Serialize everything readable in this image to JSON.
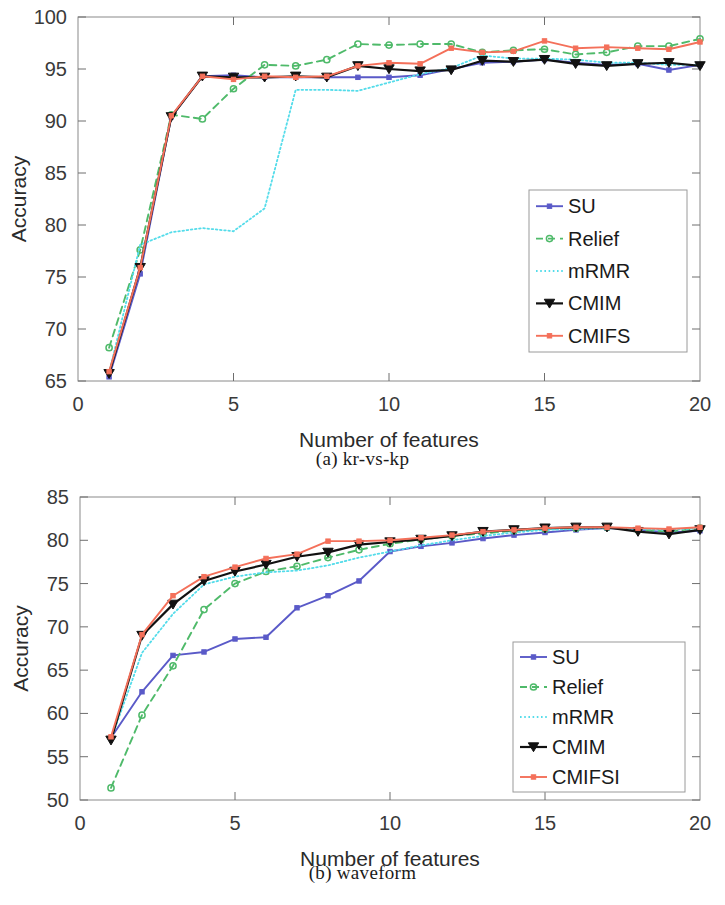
{
  "figure": {
    "panels": [
      {
        "id": "a",
        "caption": "(a)  kr-vs-kp",
        "xlabel": "Number of features",
        "ylabel": "Accuracy",
        "xticks": [
          "0",
          "5",
          "10",
          "15",
          "20"
        ],
        "yticks": [
          "65",
          "70",
          "75",
          "80",
          "85",
          "90",
          "95",
          "100"
        ],
        "legend": [
          "SU",
          "Relief",
          "mRMR",
          "CMIM",
          "CMIFS"
        ]
      },
      {
        "id": "b",
        "caption": "(b)  waveform",
        "xlabel": "Number of features",
        "ylabel": "Accuracy",
        "xticks": [
          "0",
          "5",
          "10",
          "15",
          "20"
        ],
        "yticks": [
          "50",
          "55",
          "60",
          "65",
          "70",
          "75",
          "80",
          "85"
        ],
        "legend": [
          "SU",
          "Relief",
          "mRMR",
          "CMIM",
          "CMIFSI"
        ]
      }
    ]
  },
  "colors": {
    "su": "#5a5ac8",
    "relief": "#4fba6a",
    "mrmr": "#54dcea",
    "cmim": "#111111",
    "cmifs": "#f4705a",
    "axis": "#6e6e6e",
    "text": "#2a2a2a"
  },
  "chart_data": [
    {
      "type": "line",
      "panel": "a",
      "title": "(a)  kr-vs-kp",
      "xlabel": "Number of features",
      "ylabel": "Accuracy",
      "xlim": [
        0,
        20
      ],
      "ylim": [
        65,
        100
      ],
      "xticks": [
        0,
        5,
        10,
        15,
        20
      ],
      "yticks": [
        65,
        70,
        75,
        80,
        85,
        90,
        95,
        100
      ],
      "grid": false,
      "legend_position": "lower-right",
      "x": [
        1,
        2,
        3,
        4,
        5,
        6,
        7,
        8,
        9,
        10,
        11,
        12,
        13,
        14,
        15,
        16,
        17,
        18,
        19,
        20
      ],
      "series": [
        {
          "name": "SU",
          "color": "#5a5ac8",
          "marker": "square",
          "linestyle": "solid",
          "values": [
            65.4,
            75.3,
            90.4,
            94.3,
            94.4,
            94.2,
            94.2,
            94.2,
            94.2,
            94.2,
            94.4,
            95.0,
            95.6,
            95.7,
            95.9,
            95.6,
            95.4,
            95.5,
            94.9,
            95.4
          ]
        },
        {
          "name": "Relief",
          "color": "#4fba6a",
          "marker": "circle",
          "linestyle": "dashed",
          "values": [
            68.2,
            77.6,
            90.6,
            90.2,
            93.1,
            95.4,
            95.3,
            95.9,
            97.4,
            97.3,
            97.4,
            97.4,
            96.6,
            96.8,
            96.9,
            96.4,
            96.6,
            97.2,
            97.2,
            97.9
          ]
        },
        {
          "name": "mRMR",
          "color": "#54dcea",
          "marker": "none",
          "linestyle": "dotted",
          "values": [
            65.8,
            78.1,
            79.3,
            79.7,
            79.4,
            81.6,
            93.0,
            93.0,
            92.9,
            93.7,
            94.5,
            95.1,
            96.3,
            96.0,
            96.0,
            95.9,
            95.6,
            95.6,
            95.4,
            95.4
          ]
        },
        {
          "name": "CMIM",
          "color": "#111111",
          "marker": "triangle-down",
          "linestyle": "solid",
          "values": [
            65.7,
            75.9,
            90.4,
            94.3,
            94.2,
            94.2,
            94.3,
            94.2,
            95.3,
            95.0,
            94.8,
            94.9,
            95.8,
            95.7,
            95.9,
            95.5,
            95.3,
            95.5,
            95.6,
            95.3
          ]
        },
        {
          "name": "CMIFS",
          "color": "#f4705a",
          "marker": "square",
          "linestyle": "solid",
          "values": [
            65.9,
            75.9,
            90.5,
            94.3,
            94.0,
            94.3,
            94.2,
            94.3,
            95.3,
            95.6,
            95.5,
            97.0,
            96.6,
            96.7,
            97.7,
            97.0,
            97.1,
            97.0,
            96.9,
            97.6
          ]
        }
      ]
    },
    {
      "type": "line",
      "panel": "b",
      "title": "(b)  waveform",
      "xlabel": "Number of features",
      "ylabel": "Accuracy",
      "xlim": [
        0,
        20
      ],
      "ylim": [
        50,
        85
      ],
      "xticks": [
        0,
        5,
        10,
        15,
        20
      ],
      "yticks": [
        50,
        55,
        60,
        65,
        70,
        75,
        80,
        85
      ],
      "grid": false,
      "legend_position": "lower-right",
      "x": [
        1,
        2,
        3,
        4,
        5,
        6,
        7,
        8,
        9,
        10,
        11,
        12,
        13,
        14,
        15,
        16,
        17,
        18,
        19,
        20
      ],
      "series": [
        {
          "name": "SU",
          "color": "#5a5ac8",
          "marker": "square",
          "linestyle": "solid",
          "values": [
            57.2,
            62.5,
            66.7,
            67.1,
            68.6,
            68.8,
            72.2,
            73.6,
            75.3,
            78.7,
            79.3,
            79.7,
            80.2,
            80.6,
            80.9,
            81.2,
            81.4,
            81.2,
            80.9,
            81.1
          ]
        },
        {
          "name": "Relief",
          "color": "#4fba6a",
          "marker": "circle",
          "linestyle": "dashed",
          "values": [
            51.4,
            59.8,
            65.5,
            72.0,
            75.0,
            76.4,
            77.0,
            78.0,
            78.9,
            79.6,
            80.1,
            80.5,
            80.8,
            81.1,
            81.3,
            81.4,
            81.5,
            81.2,
            81.0,
            81.4
          ]
        },
        {
          "name": "mRMR",
          "color": "#54dcea",
          "marker": "none",
          "linestyle": "dotted",
          "values": [
            57.0,
            67.0,
            71.5,
            74.9,
            75.8,
            76.3,
            76.5,
            77.1,
            78.0,
            78.7,
            79.4,
            80.0,
            80.5,
            80.9,
            81.2,
            81.3,
            81.4,
            81.3,
            81.2,
            81.4
          ]
        },
        {
          "name": "CMIM",
          "color": "#111111",
          "marker": "triangle-down",
          "linestyle": "solid",
          "values": [
            56.9,
            69.0,
            72.6,
            75.3,
            76.4,
            77.2,
            78.1,
            78.6,
            79.5,
            79.8,
            80.1,
            80.5,
            81.0,
            81.2,
            81.4,
            81.5,
            81.5,
            81.0,
            80.7,
            81.2
          ]
        },
        {
          "name": "CMIFSI",
          "color": "#f4705a",
          "marker": "square",
          "linestyle": "solid",
          "values": [
            57.3,
            69.1,
            73.6,
            75.8,
            76.9,
            77.9,
            78.4,
            79.9,
            79.9,
            80.0,
            80.3,
            80.6,
            81.0,
            81.2,
            81.4,
            81.5,
            81.5,
            81.4,
            81.3,
            81.5
          ]
        }
      ]
    }
  ]
}
